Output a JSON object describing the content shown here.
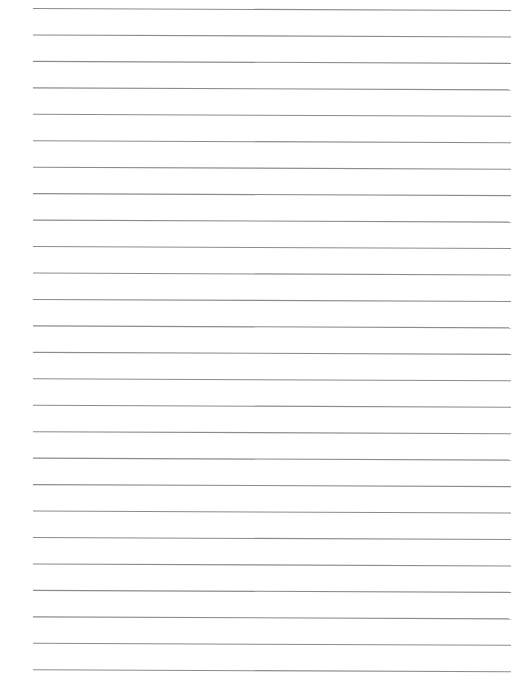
{
  "page": {
    "type": "blank-lined-paper",
    "background_color": "#ffffff",
    "line_color": "#8c8c8c",
    "line_count": 26,
    "line_start_x": 33,
    "line_end_x": 511,
    "first_line_y": 8.5,
    "line_spacing": 26.45,
    "line_slope_px": 2,
    "line_width": 1.1
  }
}
